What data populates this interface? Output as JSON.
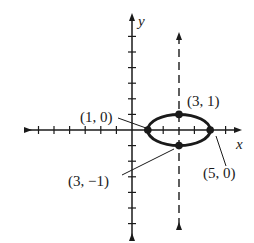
{
  "diagram": {
    "type": "ellipse-graph",
    "axes": {
      "x_label": "x",
      "y_label": "y"
    },
    "ellipse": {
      "center": [
        3,
        0
      ],
      "rx": 2,
      "ry": 1
    },
    "directrix_line": {
      "x": 3,
      "style": "dashed"
    },
    "points": [
      {
        "label": "(1, 0)",
        "x": 1,
        "y": 0
      },
      {
        "label": "(3, 1)",
        "x": 3,
        "y": 1
      },
      {
        "label": "(5, 0)",
        "x": 5,
        "y": 0
      },
      {
        "label": "(3, −1)",
        "x": 3,
        "y": -1
      }
    ],
    "colors": {
      "stroke": "#1a1a1a",
      "background": "#ffffff"
    }
  }
}
